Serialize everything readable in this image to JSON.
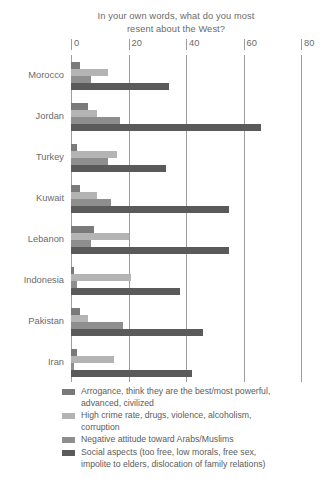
{
  "chart_data": {
    "type": "bar",
    "orientation": "horizontal",
    "title": "In your own words, what do you most resent about the West?",
    "title_line1": "In your own words, what do you most",
    "title_line2": "resent about the West?",
    "xlabel": "",
    "ylabel": "",
    "xlim": [
      0,
      80
    ],
    "ticks": [
      0,
      20,
      40,
      60,
      80
    ],
    "tick_labels": [
      "0",
      "20",
      "40",
      "60",
      "80"
    ],
    "grid": true,
    "legend_position": "bottom",
    "categories": [
      "Morocco",
      "Jordan",
      "Turkey",
      "Kuwait",
      "Lebanon",
      "Indonesia",
      "Pakistan",
      "Iran"
    ],
    "series": [
      {
        "name": "Arrogance, think they are the best/most powerful, advanced, civilized",
        "name_line1": "Arrogance, think they are the best/most powerful,",
        "name_line2": "advanced, civilized",
        "color": "#7a7a7a",
        "values": [
          3,
          6,
          2,
          3,
          8,
          1,
          3,
          2
        ]
      },
      {
        "name": "High crime rate, drugs, violence, alcoholism, corruption",
        "name_line1": "High crime rate, drugs, violence, alcoholism,",
        "name_line2": "corruption",
        "color": "#b4b4b4",
        "values": [
          13,
          9,
          16,
          9,
          20,
          21,
          6,
          15
        ]
      },
      {
        "name": "Negative attitude toward Arabs/Muslims",
        "name_line1": "Negative attitude toward Arabs/Muslims",
        "name_line2": "",
        "color": "#8e8e8e",
        "values": [
          7,
          17,
          13,
          14,
          7,
          2,
          18,
          1
        ]
      },
      {
        "name": "Social aspects (too free, low morals, free sex, impolite to elders, dislocation of family relations)",
        "name_line1": "Social aspects (too free, low morals, free sex,",
        "name_line2": "impolite to elders, dislocation of family relations)",
        "color": "#5a5a5a",
        "values": [
          34,
          66,
          33,
          55,
          55,
          38,
          46,
          42
        ]
      }
    ]
  }
}
